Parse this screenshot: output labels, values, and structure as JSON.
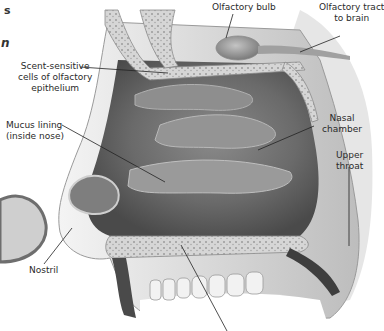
{
  "figure": {
    "cropped_title_fragments": [
      "s",
      "n"
    ],
    "colors": {
      "background": "#ffffff",
      "tissue_dark": "#5e5e5e",
      "tissue_mid": "#9a9a9a",
      "tissue_light": "#d2d2d2",
      "bone": "#c8c8c8",
      "leader_line": "#222222",
      "label_text": "#2a2a2a"
    }
  },
  "labels": {
    "olfactory_bulb": "Olfactory bulb",
    "olfactory_tract_line1": "Olfactory tract",
    "olfactory_tract_line2": "to brain",
    "scent_cells_line1": "Scent-sensitive",
    "scent_cells_line2": "cells of olfactory",
    "scent_cells_line3": "epithelium",
    "mucus_line1": "Mucus lining",
    "mucus_line2": "(inside nose)",
    "nasal_chamber_line1": "Nasal",
    "nasal_chamber_line2": "chamber",
    "upper_throat_line1": "Upper",
    "upper_throat_line2": "throat",
    "nostril": "Nostril"
  }
}
